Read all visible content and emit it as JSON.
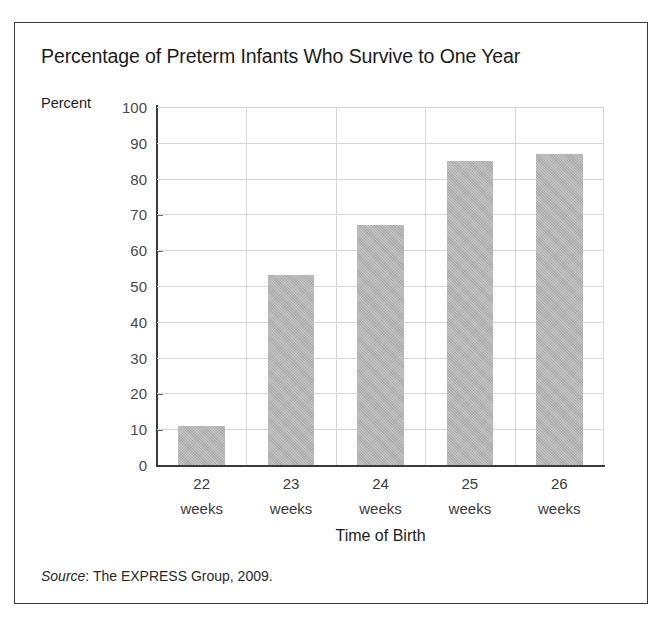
{
  "figure": {
    "title": "Percentage of Preterm Infants Who Survive to One Year",
    "y_axis_caption": "Percent",
    "x_axis_title": "Time of Birth",
    "source_word": "Source",
    "source_rest": ": The EXPRESS Group, 2009.",
    "bar_color": "#b3b3b3",
    "frame_color": "#3a3a3a",
    "gridline_color": "#d6d6d6"
  },
  "chart_data": {
    "type": "bar",
    "title": "Percentage of Preterm Infants Who Survive to One Year",
    "xlabel": "Time of Birth",
    "ylabel": "Percent",
    "categories": [
      "22 weeks",
      "23 weeks",
      "24 weeks",
      "25 weeks",
      "26 weeks"
    ],
    "category_lines": [
      {
        "num": "22",
        "unit": "weeks"
      },
      {
        "num": "23",
        "unit": "weeks"
      },
      {
        "num": "24",
        "unit": "weeks"
      },
      {
        "num": "25",
        "unit": "weeks"
      },
      {
        "num": "26",
        "unit": "weeks"
      }
    ],
    "values": [
      11,
      53,
      67,
      85,
      87
    ],
    "ylim": [
      0,
      100
    ],
    "ytick_values": [
      0,
      10,
      20,
      30,
      40,
      50,
      60,
      70,
      80,
      90,
      100
    ],
    "ytick_labels": [
      "0",
      "10",
      "20",
      "30",
      "40",
      "50",
      "60",
      "70",
      "80",
      "90",
      "100"
    ],
    "grid": "horizontal-and-vertical",
    "legend": "none",
    "annotation": "Source: The EXPRESS Group, 2009."
  }
}
